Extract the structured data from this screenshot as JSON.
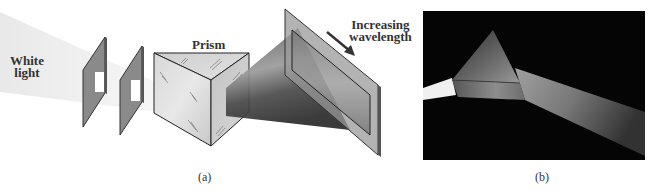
{
  "figure": {
    "panel_a": {
      "caption": "(a)",
      "labels": {
        "source_line1": "White",
        "source_line2": "light",
        "prism": "Prism",
        "arrow_line1": "Increasing",
        "arrow_line2": "wavelength"
      },
      "elements": [
        "white-light-beam",
        "slit-1",
        "slit-2",
        "prism",
        "dispersed-spectrum-beam",
        "screen",
        "wavelength-arrow"
      ]
    },
    "panel_b": {
      "caption": "(b)",
      "description": "Photograph of white light beam passing through a prism and dispersing into a spectrum on a black background"
    }
  },
  "colors": {
    "background": "#ffffff",
    "panel_fill": "#8a8a8a",
    "panel_edge": "#333333",
    "prism_fill": "#d4d4d4",
    "photo_bg": "#050505"
  }
}
